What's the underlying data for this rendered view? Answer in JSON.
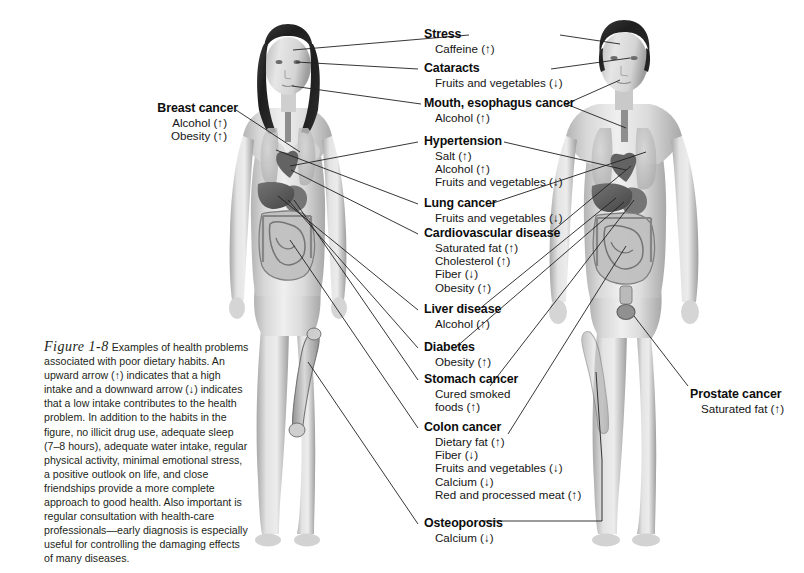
{
  "figure": {
    "number": "Figure 1-8",
    "caption": " Examples of health problems associated with poor dietary habits. An upward arrow (↑) indicates that a high intake and a downward arrow (↓) indicates that a low intake contributes to the health problem. In addition to the habits in the figure, no illicit drug use, adequate sleep (7–8 hours), adequate water intake, regular physical activity, minimal emotional stress, a positive outlook on life, and close friendships provide a more complete approach to good health. Also important is regular consultation with health-care professionals—early diagnosis is especially useful for controlling the damaging effects of many diseases."
  },
  "colors": {
    "background": "#ffffff",
    "leader_line": "#231f20",
    "title_text": "#0d0d0d",
    "item_text": "#141414",
    "caption_text": "#231f20",
    "skin_light": "#e9e9e9",
    "skin_mid": "#c9c9c9",
    "skin_dark": "#9a9a9a",
    "organ_dark": "#6a6a6a",
    "hair_dark": "#262626"
  },
  "figures": {
    "left": "female-body-diagram",
    "right": "male-body-diagram"
  },
  "labels": [
    {
      "id": "breast-cancer",
      "title": "Breast cancer",
      "items": [
        "Alcohol (↑)",
        "Obesity (↑)"
      ],
      "side": "left"
    },
    {
      "id": "stress",
      "title": "Stress",
      "items": [
        "Caffeine (↑)"
      ],
      "side": "center"
    },
    {
      "id": "cataracts",
      "title": "Cataracts",
      "items": [
        "Fruits and vegetables (↓)"
      ],
      "side": "center"
    },
    {
      "id": "mouth-esophagus-cancer",
      "title": "Mouth, esophagus cancer",
      "items": [
        "Alcohol (↑)"
      ],
      "side": "center"
    },
    {
      "id": "hypertension",
      "title": "Hypertension",
      "items": [
        "Salt (↑)",
        "Alcohol (↑)",
        "Fruits and vegetables (↓)"
      ],
      "side": "center"
    },
    {
      "id": "lung-cancer",
      "title": "Lung cancer",
      "items": [
        "Fruits and vegetables (↓)"
      ],
      "side": "center"
    },
    {
      "id": "cardiovascular-disease",
      "title": "Cardiovascular disease",
      "items": [
        "Saturated fat (↑)",
        "Cholesterol (↑)",
        "Fiber (↓)",
        "Obesity (↑)"
      ],
      "side": "center"
    },
    {
      "id": "liver-disease",
      "title": "Liver disease",
      "items": [
        "Alcohol (↑)"
      ],
      "side": "center"
    },
    {
      "id": "diabetes",
      "title": "Diabetes",
      "items": [
        "Obesity (↑)"
      ],
      "side": "center"
    },
    {
      "id": "stomach-cancer",
      "title": "Stomach cancer",
      "items": [
        "Cured smoked",
        "foods (↑)"
      ],
      "side": "center"
    },
    {
      "id": "colon-cancer",
      "title": "Colon cancer",
      "items": [
        "Dietary fat (↑)",
        "Fiber (↓)",
        "Fruits and vegetables (↓)",
        "Calcium (↓)",
        "Red and processed meat (↑)"
      ],
      "side": "center"
    },
    {
      "id": "osteoporosis",
      "title": "Osteoporosis",
      "items": [
        "Calcium (↓)"
      ],
      "side": "center"
    },
    {
      "id": "prostate-cancer",
      "title": "Prostate cancer",
      "items": [
        "Saturated fat (↑)"
      ],
      "side": "right"
    }
  ]
}
